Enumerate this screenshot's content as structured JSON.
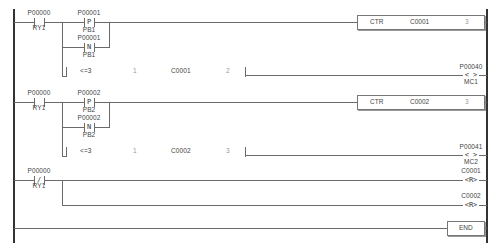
{
  "diagram": {
    "type": "ladder-logic",
    "rungs": [
      {
        "id": 1,
        "contacts": [
          {
            "address": "P00000",
            "label": "RY1",
            "type": "NO"
          },
          {
            "address": "P00001",
            "label": "PB1",
            "type": "P"
          },
          {
            "address": "P00001",
            "label": "PB1",
            "type": "N"
          }
        ],
        "compare": {
          "op": "<=3",
          "in1": "1",
          "in2": "C0001",
          "in3": "2"
        },
        "instruction": {
          "name": "CTR",
          "operand": "C0001",
          "value": "3"
        },
        "coil": {
          "address": "P00040",
          "label": "MC1",
          "symbol": "< >"
        }
      },
      {
        "id": 2,
        "contacts": [
          {
            "address": "P00000",
            "label": "RY1",
            "type": "NO"
          },
          {
            "address": "P00002",
            "label": "PB2",
            "type": "P"
          },
          {
            "address": "P00002",
            "label": "PB2",
            "type": "N"
          }
        ],
        "compare": {
          "op": "<=3",
          "in1": "1",
          "in2": "C0002",
          "in3": "3"
        },
        "instruction": {
          "name": "CTR",
          "operand": "C0002",
          "value": "3"
        },
        "coil": {
          "address": "P00041",
          "label": "MC2",
          "symbol": "< >"
        }
      },
      {
        "id": 3,
        "contacts": [
          {
            "address": "P00000",
            "label": "RY1",
            "type": "NC"
          }
        ],
        "coils": [
          {
            "address": "C0001",
            "symbol": "<R>"
          },
          {
            "address": "C0002",
            "symbol": "<R>"
          }
        ]
      }
    ],
    "end_label": "END",
    "symbols": {
      "no_contact": "─┤ ├─",
      "nc_contact": "─┤/├─",
      "p_contact": "┤P├",
      "n_contact": "┤N├",
      "coil": "< >",
      "reset_coil": "<R>"
    },
    "text": {
      "p": "P",
      "n": "N",
      "slash": "/",
      "coil_open": "<",
      "coil_close": ">",
      "r": "R"
    }
  }
}
